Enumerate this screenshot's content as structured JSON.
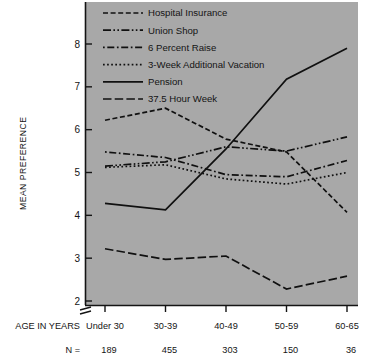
{
  "figure": {
    "plot_background": "#a8a8a8",
    "line_color": "#101010",
    "page_background": "#ffffff"
  },
  "axes": {
    "ylabel": "MEAN PREFERENCE",
    "y_ticks": [
      "2",
      "3",
      "4",
      "5",
      "6",
      "7",
      "8"
    ],
    "ylim": [
      2,
      8
    ],
    "axis_break": true,
    "xlabel_row": "AGE IN YEARS",
    "n_row_label": "N ="
  },
  "chart_data": {
    "type": "line",
    "title": "",
    "xlabel": "AGE IN YEARS",
    "ylabel": "MEAN PREFERENCE",
    "ylim": [
      2,
      8
    ],
    "grid": false,
    "legend_position": "top-left-inside",
    "categories": [
      "Under 30",
      "30-39",
      "40-49",
      "50-59",
      "60-65"
    ],
    "sample_sizes": [
      189,
      455,
      303,
      150,
      36
    ],
    "series": [
      {
        "name": "Hospital Insurance",
        "linestyle": "dashed",
        "dasharray": "5,2.6",
        "values": [
          6.22,
          6.5,
          5.78,
          5.48,
          4.07
        ]
      },
      {
        "name": "Union Shop",
        "linestyle": "dash-dot-dot",
        "dasharray": "8,2.4,1.6,2.4,1.6,2.4",
        "values": [
          5.15,
          5.25,
          5.6,
          5.5,
          5.83
        ]
      },
      {
        "name": "6 Percent Raise",
        "linestyle": "dash-dot",
        "dasharray": "1.7,2.6,7,2.6",
        "values": [
          5.48,
          5.35,
          4.95,
          4.9,
          5.28
        ]
      },
      {
        "name": "3-Week Additional Vacation",
        "linestyle": "dotted",
        "dasharray": "1.7,2.4",
        "values": [
          5.12,
          5.18,
          4.85,
          4.73,
          5.0
        ]
      },
      {
        "name": "Pension",
        "linestyle": "solid",
        "dasharray": "",
        "values": [
          4.28,
          4.13,
          5.55,
          7.18,
          7.9
        ]
      },
      {
        "name": "37.5 Hour Week",
        "linestyle": "long-dashed",
        "dasharray": "8.5,3.2",
        "values": [
          3.22,
          2.97,
          3.05,
          2.28,
          2.58
        ]
      }
    ]
  }
}
